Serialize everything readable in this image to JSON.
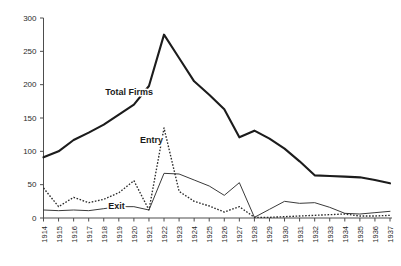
{
  "chart_data": {
    "type": "line",
    "title": "",
    "subtitle": "",
    "xlabel": "",
    "ylabel": "",
    "grid": false,
    "legend_position": "inline-annotations",
    "categories": [
      "1914",
      "1915",
      "1916",
      "1917",
      "1918",
      "1919",
      "1920",
      "1921",
      "1922",
      "1923",
      "1924",
      "1925",
      "1926",
      "1927",
      "1928",
      "1929",
      "1930",
      "1931",
      "1932",
      "1933",
      "1934",
      "1935",
      "1936",
      "1937"
    ],
    "x": [
      1914,
      1915,
      1916,
      1917,
      1918,
      1919,
      1920,
      1921,
      1922,
      1923,
      1924,
      1925,
      1926,
      1927,
      1928,
      1929,
      1930,
      1931,
      1932,
      1933,
      1934,
      1935,
      1936,
      1937
    ],
    "ylim": [
      0,
      300
    ],
    "xlim": [
      1914,
      1937
    ],
    "yticks": [
      0,
      50,
      100,
      150,
      200,
      250,
      300
    ],
    "ytick_labels": [
      "0",
      "50",
      "100",
      "150",
      "200",
      "250",
      "300"
    ],
    "series": [
      {
        "name": "Total Firms",
        "style": "solid-thick",
        "color": "#1c1c1c",
        "values": [
          91,
          100,
          117,
          128,
          140,
          155,
          170,
          198,
          275,
          240,
          205,
          185,
          163,
          121,
          131,
          119,
          104,
          85,
          64,
          63,
          62,
          61,
          57,
          52
        ]
      },
      {
        "name": "Entry",
        "style": "dotted",
        "color": "#2b2b2b",
        "values": [
          45,
          17,
          31,
          23,
          28,
          38,
          56,
          12,
          135,
          40,
          25,
          18,
          9,
          17,
          1,
          1,
          2,
          3,
          4,
          5,
          6,
          3,
          3,
          4
        ]
      },
      {
        "name": "Exit",
        "style": "solid-thin",
        "color": "#3a3a3a",
        "values": [
          12,
          11,
          12,
          11,
          14,
          17,
          17,
          12,
          67,
          66,
          57,
          48,
          34,
          53,
          1,
          13,
          25,
          22,
          23,
          16,
          7,
          6,
          8,
          10
        ]
      }
    ],
    "annotations": [
      {
        "text": "Total Firms",
        "series": "Total Firms",
        "x": 1918.1,
        "y": 185
      },
      {
        "text": "Entry",
        "series": "Entry",
        "x": 1920.4,
        "y": 113
      },
      {
        "text": "Exit",
        "series": "Exit",
        "x": 1918.3,
        "y": 13
      }
    ]
  },
  "axes": {
    "y_axis_name": "value-axis",
    "x_axis_name": "year-axis"
  }
}
